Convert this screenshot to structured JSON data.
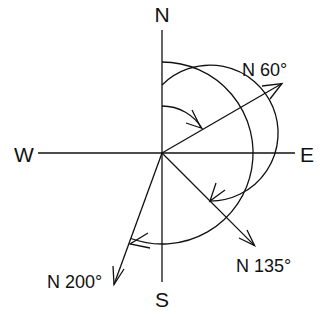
{
  "diagram": {
    "center": [
      162,
      153
    ],
    "cardinals": [
      {
        "label": "N",
        "x": 162,
        "y": 22
      },
      {
        "label": "E",
        "x": 308,
        "y": 162
      },
      {
        "label": "S",
        "x": 162,
        "y": 306
      },
      {
        "label": "W",
        "x": 22,
        "y": 162
      }
    ],
    "bearings": [
      {
        "label": "N 60°",
        "azimuth": 60,
        "length": 139,
        "arc_radius": 47,
        "label_x": 242,
        "label_y": 75
      },
      {
        "label": "N 135°",
        "azimuth": 135,
        "length": 131,
        "arc_radius": 68,
        "label_x": 235,
        "label_y": 271
      },
      {
        "label": "N 200°",
        "azimuth": 200,
        "length": 140,
        "arc_radius": 91,
        "label_x": 47,
        "label_y": 287
      }
    ],
    "colors": {
      "line": "#111111",
      "background": "#ffffff"
    }
  }
}
